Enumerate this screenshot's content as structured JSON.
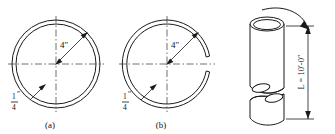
{
  "figure": {
    "background_color": "#ffffff",
    "line_color": "#1a1a1a",
    "centerline_color": "#4a4a4a"
  },
  "panel_a": {
    "caption": "(a)",
    "name": "closed-ring-cross-section",
    "diameter_label": "4″",
    "thickness_numerator": "1",
    "thickness_denominator": "4",
    "thickness_unit": "″"
  },
  "panel_b": {
    "caption": "(b)",
    "name": "slit-ring-cross-section",
    "diameter_label": "4″",
    "thickness_numerator": "1",
    "thickness_denominator": "4",
    "thickness_unit": "″"
  },
  "panel_c": {
    "name": "tube-pictorial",
    "length_label": "L = 10′-0″",
    "torque_arrow": "curved-torque-arrow"
  }
}
